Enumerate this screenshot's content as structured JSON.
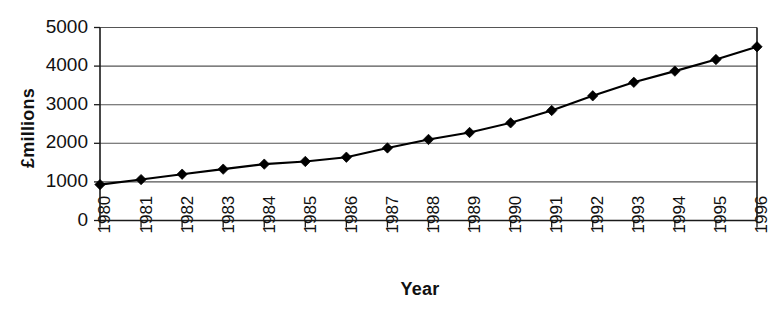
{
  "chart_data": {
    "type": "line",
    "title": "",
    "xlabel": "Year",
    "ylabel": "£millions",
    "categories": [
      "1980",
      "1981",
      "1982",
      "1983",
      "1984",
      "1985",
      "1986",
      "1987",
      "1988",
      "1989",
      "1990",
      "1991",
      "1992",
      "1993",
      "1994",
      "1995",
      "1996"
    ],
    "values": [
      930,
      1060,
      1200,
      1330,
      1460,
      1530,
      1640,
      1880,
      2100,
      2280,
      2530,
      2850,
      3230,
      3580,
      3870,
      4170,
      4500
    ],
    "series": [
      {
        "name": "£millions",
        "values": [
          930,
          1060,
          1200,
          1330,
          1460,
          1530,
          1640,
          1880,
          2100,
          2280,
          2530,
          2850,
          3230,
          3580,
          3870,
          4170,
          4500
        ]
      }
    ],
    "ylim": [
      0,
      5000
    ],
    "yticks": [
      0,
      1000,
      2000,
      3000,
      4000,
      5000
    ],
    "ytick_labels": [
      "0",
      "1000",
      "2000",
      "3000",
      "4000",
      "5000"
    ],
    "grid": true,
    "grid_axis": "y",
    "legend": "none",
    "marker": "diamond",
    "line_color": "#000000",
    "marker_color": "#000000",
    "grid_color": "#555555",
    "axis_color": "#1a1a1a",
    "background": "#ffffff",
    "xtick_rotation": -90
  }
}
